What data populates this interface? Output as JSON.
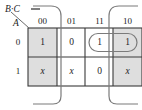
{
  "diagram": {
    "type": "karnaugh-map",
    "title": "",
    "col_var_label": "B·C",
    "row_var_label": "A",
    "col_headers": [
      "00",
      "01",
      "11",
      "10"
    ],
    "row_headers": [
      "0",
      "1"
    ],
    "cells": [
      {
        "row": "0",
        "col": "00",
        "value": "1",
        "shaded": true
      },
      {
        "row": "0",
        "col": "01",
        "value": "0",
        "shaded": false
      },
      {
        "row": "0",
        "col": "11",
        "value": "1",
        "shaded": false
      },
      {
        "row": "0",
        "col": "10",
        "value": "1",
        "shaded": true
      },
      {
        "row": "1",
        "col": "00",
        "value": "x",
        "shaded": true
      },
      {
        "row": "1",
        "col": "01",
        "value": "x",
        "shaded": false
      },
      {
        "row": "1",
        "col": "11",
        "value": "0",
        "shaded": false
      },
      {
        "row": "1",
        "col": "10",
        "value": "x",
        "shaded": true
      }
    ],
    "groups": [
      {
        "name": "group-row0-col11-col10",
        "shape": "horizontal-oval"
      },
      {
        "name": "group-col00-wrap",
        "shape": "vertical-oval-wrap"
      },
      {
        "name": "group-col10-wrap",
        "shape": "vertical-oval-wrap"
      }
    ],
    "colors": {
      "shaded_cell": "#dedede",
      "unshaded_cell": "#ffffff",
      "grid_line": "#3a3a3a",
      "loop_line": "#6e6e6e",
      "text": "#1d1d1d"
    }
  }
}
